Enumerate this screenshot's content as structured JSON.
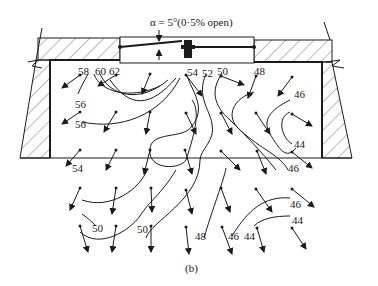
{
  "figure": {
    "caption": "(b)",
    "annotation": "α = 5°(0·5% open)",
    "colors": {
      "ink": "#1a1a1a",
      "background": "#ffffff",
      "hatch": "#555555"
    }
  },
  "contour_labels": {
    "l58": "58",
    "l60": "60",
    "l62": "62",
    "l54_top": "54",
    "l52": "52",
    "l50_top": "50",
    "l48_top": "48",
    "l46_right": "46",
    "l56_a": "56",
    "l56_b": "56",
    "l44_mid": "44",
    "l46_mid": "46",
    "l54_left": "54",
    "l46_low": "46",
    "l44_low": "44",
    "l50_left": "50",
    "l50_center": "50",
    "l48_bottom": "48",
    "l46_bottom": "46",
    "l44_bottom": "44"
  }
}
